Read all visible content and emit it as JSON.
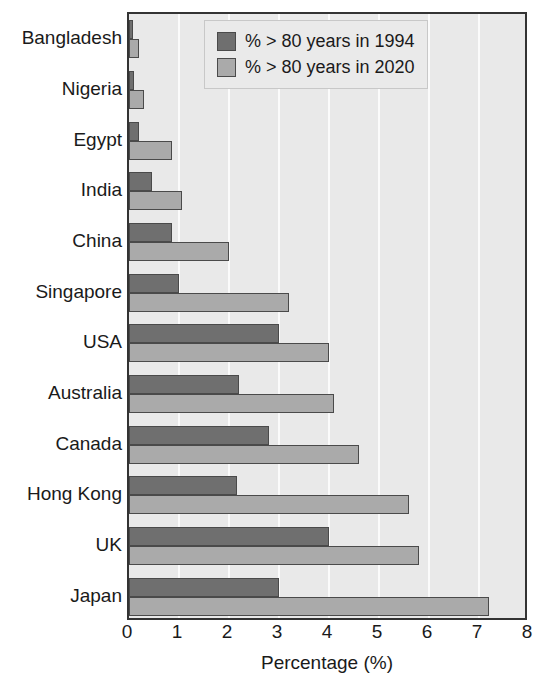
{
  "chart_data": {
    "type": "bar",
    "orientation": "horizontal",
    "title": "",
    "xlabel": "Percentage (%)",
    "ylabel": "",
    "xlim": [
      0,
      8
    ],
    "xticks": [
      "0",
      "1",
      "2",
      "3",
      "4",
      "5",
      "6",
      "7",
      "8"
    ],
    "grid": true,
    "legend_position": "top-right",
    "categories": [
      "Bangladesh",
      "Nigeria",
      "Egypt",
      "India",
      "China",
      "Singapore",
      "USA",
      "Australia",
      "Canada",
      "Hong Kong",
      "UK",
      "Japan"
    ],
    "series": [
      {
        "name": "% > 80 years in 1994",
        "color": "#6f6f6f",
        "values": [
          0.08,
          0.1,
          0.2,
          0.45,
          0.85,
          1.0,
          3.0,
          2.2,
          2.8,
          2.15,
          4.0,
          3.0
        ]
      },
      {
        "name": "% > 80 years in 2020",
        "color": "#aaaaaa",
        "values": [
          0.2,
          0.3,
          0.85,
          1.05,
          2.0,
          3.2,
          4.0,
          4.1,
          4.6,
          5.6,
          5.8,
          7.2
        ]
      }
    ]
  },
  "legend": {
    "items": [
      {
        "label": "% > 80 years in 1994",
        "swatch": "series-1994"
      },
      {
        "label": "% > 80 years in 2020",
        "swatch": "series-2020"
      }
    ]
  },
  "axis": {
    "x_title": "Percentage (%)"
  }
}
